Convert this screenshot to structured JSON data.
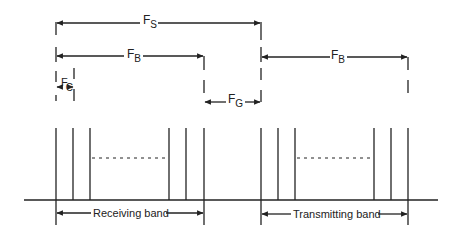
{
  "diagram": {
    "colors": {
      "line": "#222222",
      "background": "#ffffff"
    },
    "dimensions": {
      "fs": {
        "symbol": "F",
        "subscript": "S",
        "meaning": "band separation"
      },
      "fb_receiving": {
        "symbol": "F",
        "subscript": "B",
        "meaning": "bandwidth"
      },
      "fb_transmitting": {
        "symbol": "F",
        "subscript": "B",
        "meaning": "bandwidth"
      },
      "fc": {
        "symbol": "F",
        "subscript": "C",
        "meaning": "channel spacing"
      },
      "fg": {
        "symbol": "F",
        "subscript": "G",
        "meaning": "guard band"
      }
    },
    "bands": [
      {
        "label": "Receiving band",
        "channel_lines_x": [
          56,
          73,
          90,
          169,
          186,
          204
        ],
        "ellipsis": "- - - - - - - - - -"
      },
      {
        "label": "Transmitting band",
        "channel_lines_x": [
          261,
          278,
          295,
          374,
          391,
          408
        ],
        "ellipsis": "- - - - - - - - - -"
      }
    ]
  }
}
